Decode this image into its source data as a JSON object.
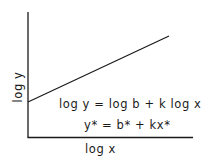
{
  "diagram": {
    "type": "log-log linear relationship sketch",
    "axes": {
      "x_label": "log x",
      "y_label": "log y"
    },
    "line": {
      "description": "straight line with positive slope k and intercept log b",
      "start": [
        28,
        102
      ],
      "end": [
        169,
        36
      ]
    },
    "equations": {
      "log_form": "log y = log b + k log x",
      "linear_form": "y* = b* + kx*"
    },
    "colors": {
      "ink": "#1a1a1a",
      "background": "#ffffff"
    }
  }
}
